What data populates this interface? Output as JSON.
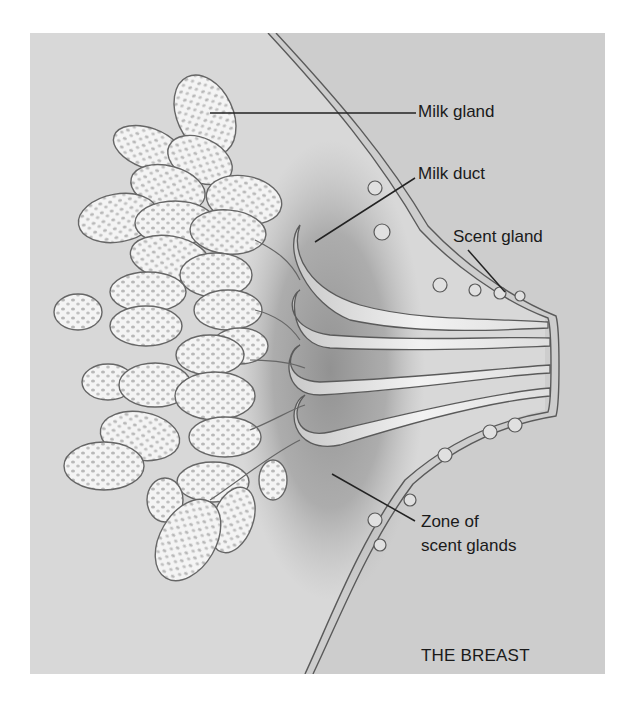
{
  "figure": {
    "title": "THE BREAST",
    "background_color": "#d8d8d8",
    "outer_region_color": "#cdcdcd",
    "line_color": "#555555"
  },
  "labels": {
    "milk_gland": "Milk gland",
    "milk_duct": "Milk duct",
    "scent_gland": "Scent gland",
    "zone_line1": "Zone of",
    "zone_line2": "scent glands"
  }
}
